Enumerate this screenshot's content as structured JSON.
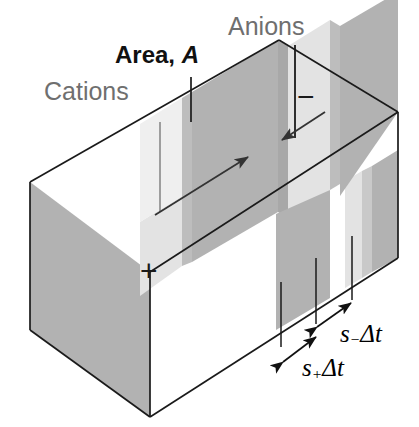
{
  "figure": {
    "background_color": "#ffffff"
  },
  "labels": {
    "cations": "Cations",
    "anions": "Anions",
    "area": "Area, ",
    "area_symbol": "A",
    "positive_electrode": "+",
    "negative_electrode": "−"
  },
  "dimensions": [
    {
      "id": "anion-distance",
      "symbol": "s",
      "subscript": "−",
      "suffix": "Δt",
      "text": "s_Δt",
      "meaning": "distance travelled by anions in time Δt"
    },
    {
      "id": "cation-distance",
      "symbol": "s",
      "subscript": "+",
      "suffix": "Δt",
      "text": "s+Δt",
      "meaning": "distance travelled by cations in time Δt"
    }
  ],
  "colors": {
    "outline": "#1a1a1a",
    "label_gray": "#6f6f6f",
    "label_black": "#111111",
    "face_dark": "#b2b2b2",
    "face_mid": "#c9c9c9",
    "face_light": "#e3e3e3",
    "face_lighter": "#efefef",
    "face_white": "#ffffff",
    "leader_gray": "#8a8a8a",
    "arrow": "#333333"
  },
  "arrows": [
    {
      "id": "cation-flow-arrow",
      "direction": "right-up",
      "meaning": "cations drift toward the negative electrode"
    },
    {
      "id": "anion-flow-arrow",
      "direction": "left-down",
      "meaning": "anions drift toward the positive electrode"
    }
  ],
  "leaders": [
    {
      "id": "cations-leader",
      "style": "gray-vertical"
    },
    {
      "id": "area-leader",
      "style": "dark-vertical-short"
    },
    {
      "id": "anions-leader",
      "style": "dark-vertical-long"
    }
  ]
}
